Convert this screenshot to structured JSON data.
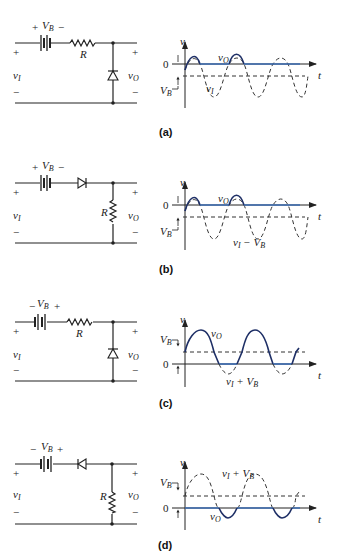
{
  "figure": {
    "colors": {
      "output_wave": "#3c6db4",
      "wire": "#222222",
      "dashed": "#333333"
    },
    "panels": [
      {
        "caption": "(a)",
        "circuit": {
          "battery_label": "V",
          "battery_sub": "B",
          "battery_polarity_left": "+",
          "battery_polarity_right": "−",
          "series_element": "resistor",
          "series_label": "R",
          "shunt_element": "diode",
          "shunt_label": "",
          "input_label": "v",
          "input_sub": "I",
          "output_label": "v",
          "output_sub": "O",
          "plus": "+",
          "minus": "−"
        },
        "graph": {
          "y_axis_label": "v",
          "x_axis_label": "t",
          "zero_label": "0",
          "vb_label": "V",
          "vb_sub": "B",
          "output_curve_label": "v",
          "output_curve_sub": "O",
          "input_curve_label": "v",
          "input_curve_sub": "I",
          "input_curve_suffix": ""
        }
      },
      {
        "caption": "(b)",
        "circuit": {
          "battery_label": "V",
          "battery_sub": "B",
          "battery_polarity_left": "+",
          "battery_polarity_right": "−",
          "series_element": "diode",
          "series_label": "",
          "shunt_element": "resistor",
          "shunt_label": "R",
          "input_label": "v",
          "input_sub": "I",
          "output_label": "v",
          "output_sub": "O",
          "plus": "+",
          "minus": "−"
        },
        "graph": {
          "y_axis_label": "v",
          "x_axis_label": "t",
          "zero_label": "0",
          "vb_label": "V",
          "vb_sub": "B",
          "output_curve_label": "v",
          "output_curve_sub": "O",
          "input_curve_label": "v",
          "input_curve_sub": "I",
          "input_curve_suffix": " − V",
          "input_curve_suffix_sub": "B"
        }
      },
      {
        "caption": "(c)",
        "circuit": {
          "battery_label": "V",
          "battery_sub": "B",
          "battery_polarity_left": "−",
          "battery_polarity_right": "+",
          "series_element": "resistor",
          "series_label": "R",
          "shunt_element": "diode",
          "shunt_label": "",
          "input_label": "v",
          "input_sub": "I",
          "output_label": "v",
          "output_sub": "O",
          "plus": "+",
          "minus": "−"
        },
        "graph": {
          "y_axis_label": "v",
          "x_axis_label": "t",
          "zero_label": "0",
          "vb_label": "V",
          "vb_sub": "B",
          "output_curve_label": "v",
          "output_curve_sub": "O",
          "input_curve_label": "v",
          "input_curve_sub": "I",
          "input_curve_suffix": " + V",
          "input_curve_suffix_sub": "B"
        }
      },
      {
        "caption": "(d)",
        "circuit": {
          "battery_label": "V",
          "battery_sub": "B",
          "battery_polarity_left": "−",
          "battery_polarity_right": "+",
          "series_element": "diode",
          "series_label": "",
          "shunt_element": "resistor",
          "shunt_label": "R",
          "input_label": "v",
          "input_sub": "I",
          "output_label": "v",
          "output_sub": "O",
          "plus": "+",
          "minus": "−"
        },
        "graph": {
          "y_axis_label": "v",
          "x_axis_label": "t",
          "zero_label": "0",
          "vb_label": "V",
          "vb_sub": "B",
          "output_curve_label": "v",
          "output_curve_sub": "O",
          "input_curve_label": "v",
          "input_curve_sub": "I",
          "input_curve_suffix": " + V",
          "input_curve_suffix_sub": "B"
        }
      }
    ]
  }
}
